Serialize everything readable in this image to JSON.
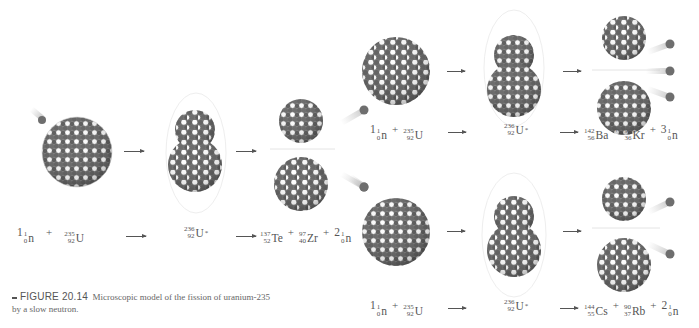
{
  "figure": {
    "number_label": "FIGURE 20.14",
    "caption_text": "Microscopic model of the fission of uranium-235 by a slow neutron."
  },
  "colors": {
    "nucleon_dark": "#6a6a6a",
    "nucleon_light": "#ffffff",
    "text": "#555555",
    "neutron": "#6e6e6e"
  },
  "reactions": [
    {
      "id": "te-zr",
      "reactants": {
        "neutron": {
          "coef": "1",
          "mass": "1",
          "atomic": "0",
          "symbol": "n"
        },
        "plus": "+",
        "uranium": {
          "mass": "235",
          "atomic": "92",
          "symbol": "U"
        }
      },
      "intermediate": {
        "mass": "236",
        "atomic": "92",
        "symbol": "U",
        "excited": "*"
      },
      "products": [
        {
          "coef": "",
          "mass": "137",
          "atomic": "52",
          "symbol": "Te"
        },
        {
          "coef": "",
          "mass": "97",
          "atomic": "40",
          "symbol": "Zr"
        },
        {
          "coef": "2",
          "mass": "1",
          "atomic": "0",
          "symbol": "n"
        }
      ],
      "neutrons_released": 2
    },
    {
      "id": "ba-kr",
      "reactants": {
        "neutron": {
          "coef": "1",
          "mass": "1",
          "atomic": "0",
          "symbol": "n"
        },
        "plus": "+",
        "uranium": {
          "mass": "235",
          "atomic": "92",
          "symbol": "U"
        }
      },
      "intermediate": {
        "mass": "236",
        "atomic": "92",
        "symbol": "U",
        "excited": "*"
      },
      "products": [
        {
          "coef": "",
          "mass": "142",
          "atomic": "56",
          "symbol": "Ba"
        },
        {
          "coef": "",
          "mass": "91",
          "atomic": "36",
          "symbol": "Kr"
        },
        {
          "coef": "3",
          "mass": "1",
          "atomic": "0",
          "symbol": "n"
        }
      ],
      "neutrons_released": 3
    },
    {
      "id": "cs-rb",
      "reactants": {
        "neutron": {
          "coef": "1",
          "mass": "1",
          "atomic": "0",
          "symbol": "n"
        },
        "plus": "+",
        "uranium": {
          "mass": "235",
          "atomic": "92",
          "symbol": "U"
        }
      },
      "intermediate": {
        "mass": "236",
        "atomic": "92",
        "symbol": "U",
        "excited": "*"
      },
      "products": [
        {
          "coef": "",
          "mass": "144",
          "atomic": "55",
          "symbol": "Cs"
        },
        {
          "coef": "",
          "mass": "90",
          "atomic": "37",
          "symbol": "Rb"
        },
        {
          "coef": "2",
          "mass": "1",
          "atomic": "0",
          "symbol": "n"
        }
      ],
      "neutrons_released": 2
    }
  ],
  "symbols": {
    "plus": "+"
  }
}
